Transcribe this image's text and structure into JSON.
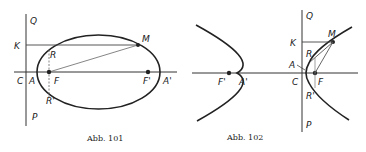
{
  "figures": [
    {
      "caption": "Abb. 101",
      "curve": "ellipse",
      "labels": {
        "Q": "Q",
        "K": "K",
        "R": "R",
        "M": "M",
        "C": "C",
        "A": "A",
        "F": "F",
        "F_prime": "F'",
        "A_prime": "A'",
        "R_prime": "R'",
        "P": "P"
      }
    },
    {
      "caption": "Abb. 102",
      "curve": "hyperbola",
      "labels": {
        "Q": "Q",
        "K": "K",
        "M": "M",
        "R": "R",
        "A": "A",
        "C": "C",
        "F": "F",
        "R_prime": "R'",
        "P": "P",
        "F_prime": "F'",
        "A_prime": "A'"
      }
    }
  ],
  "colors": {
    "stroke": "#222222",
    "background": "#ffffff"
  }
}
